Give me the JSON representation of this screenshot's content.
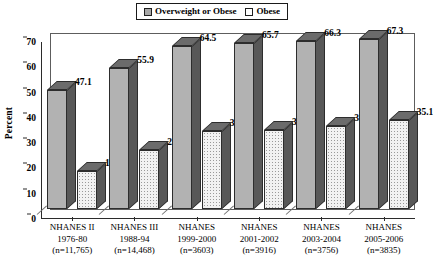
{
  "chart_data": {
    "type": "bar",
    "title": "",
    "xlabel": "",
    "ylabel": "Percent",
    "ylim": [
      0,
      70
    ],
    "yticks": [
      0,
      10,
      20,
      30,
      40,
      50,
      60,
      70
    ],
    "grid": false,
    "legend_position": "top-center",
    "categories": [
      "NHANES II\n1976-80\n(n=11,765)",
      "NHANES III\n1988-94\n(n=14,468)",
      "NHANES\n1999-2000\n(n=3603)",
      "NHANES\n2001-2002\n(n=3916)",
      "NHANES\n2003-2004\n(n=3756)",
      "NHANES\n2005-2006\n(n=3835)"
    ],
    "category_lines": [
      [
        "NHANES II",
        "1976-80",
        "(n=11,765)"
      ],
      [
        "NHANES III",
        "1988-94",
        "(n=14,468)"
      ],
      [
        "NHANES",
        "1999-2000",
        "(n=3603)"
      ],
      [
        "NHANES",
        "2001-2002",
        "(n=3916)"
      ],
      [
        "NHANES",
        "2003-2004",
        "(n=3756)"
      ],
      [
        "NHANES",
        "2005-2006",
        "(n=3835)"
      ]
    ],
    "series": [
      {
        "name": "Overweight or Obese",
        "color": "#b2b2b2",
        "values": [
          47.1,
          55.9,
          64.5,
          65.7,
          66.3,
          67.3
        ],
        "labels": [
          "47.1",
          "55.9",
          "64.5",
          "65.7",
          "66.3",
          "67.3"
        ]
      },
      {
        "name": "Obese",
        "color": "#ffffff",
        "values": [
          15,
          23.2,
          30.9,
          31.3,
          32.9,
          35.1
        ],
        "labels": [
          "15",
          "23.2",
          "30.9",
          "31.3",
          "32.9",
          "35.1"
        ]
      }
    ]
  },
  "legend": {
    "entries": [
      {
        "label": "Overweight or Obese"
      },
      {
        "label": "Obese"
      }
    ]
  },
  "axis": {
    "y_title": "Percent",
    "y_tick_labels": [
      "70",
      "60",
      "50",
      "40",
      "30",
      "20",
      "10",
      "0"
    ]
  }
}
